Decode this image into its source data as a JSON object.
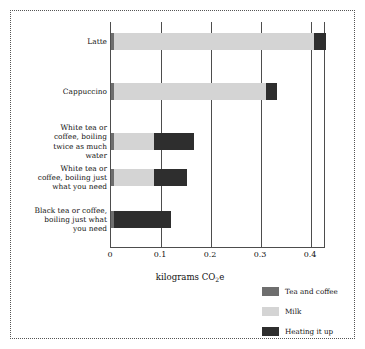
{
  "chart_data": {
    "type": "bar",
    "orientation": "horizontal",
    "stacked": true,
    "title": "",
    "subtitle": "",
    "xlabel": "kilograms CO2e",
    "xlabel_rich": "kilograms CO",
    "xlabel_sub": "2",
    "xlabel_tail": "e",
    "ylabel": "",
    "xlim": [
      0,
      0.43
    ],
    "ylim": null,
    "grid": "vertical",
    "legend_position": "bottom-right",
    "xticks": [
      {
        "value": 0,
        "label": "0"
      },
      {
        "value": 0.1,
        "label": "0.1"
      },
      {
        "value": 0.2,
        "label": "0.2"
      },
      {
        "value": 0.3,
        "label": "0.3"
      },
      {
        "value": 0.4,
        "label": "0.4"
      }
    ],
    "categories": [
      "Latte",
      "Cappuccino",
      "White tea or coffee, boiling twice as much water",
      "White tea or coffee, boiling just what you need",
      "Black tea or coffee, boiling just what you need"
    ],
    "series": [
      {
        "name": "Tea and coffee",
        "color": "#6e6e6e",
        "values": [
          0.005,
          0.005,
          0.005,
          0.005,
          0.005
        ]
      },
      {
        "name": "Milk",
        "color": "#d4d4d4",
        "values": [
          0.4,
          0.305,
          0.08,
          0.08,
          0.0
        ]
      },
      {
        "name": "Heating it up",
        "color": "#2e2e2e",
        "values": [
          0.025,
          0.022,
          0.08,
          0.067,
          0.115
        ]
      }
    ],
    "totals": [
      0.43,
      0.332,
      0.165,
      0.152,
      0.12
    ]
  },
  "categories_display": [
    {
      "lines": [
        "Latte"
      ]
    },
    {
      "lines": [
        "Cappuccino"
      ]
    },
    {
      "lines": [
        "White tea or",
        "coffee, boiling",
        "twice as much",
        "water"
      ]
    },
    {
      "lines": [
        "White tea or",
        "coffee, boiling just",
        "what you need"
      ]
    },
    {
      "lines": [
        "Black tea or coffee,",
        "boiling just what",
        "you need"
      ]
    }
  ],
  "axis": {
    "title_main": "kilograms CO",
    "title_sub": "2",
    "title_tail": "e",
    "ticks": [
      "0",
      "0.1",
      "0.2",
      "0.3",
      "0.4"
    ]
  },
  "legend": {
    "items": [
      {
        "label": "Tea and coffee",
        "color": "#6e6e6e"
      },
      {
        "label": "Milk",
        "color": "#d4d4d4"
      },
      {
        "label": "Heating it up",
        "color": "#2e2e2e"
      }
    ]
  },
  "colors": {
    "tea_and_coffee": "#6e6e6e",
    "milk": "#d4d4d4",
    "heating_it_up": "#2e2e2e",
    "axis": "#4d4d4d",
    "frame": "#555555",
    "text": "#111111",
    "background": "#ffffff"
  }
}
